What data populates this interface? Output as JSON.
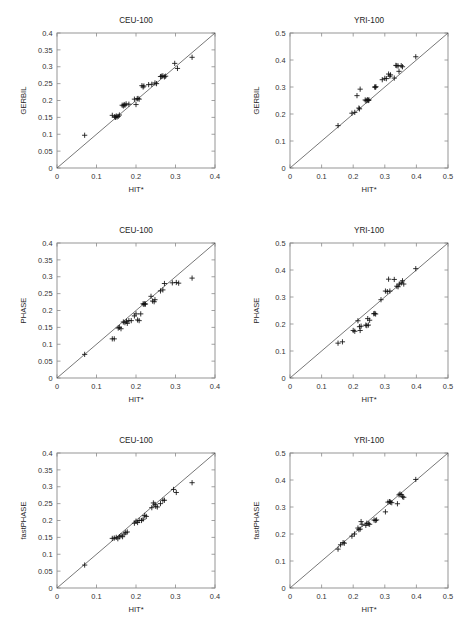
{
  "figure": {
    "width": 467,
    "height": 630,
    "background": "#ffffff",
    "marker_symbol": "plus",
    "marker_color": "#111111",
    "frame_color": "#8a8a8a",
    "identity_line_color": "#4a4a4a",
    "rows": 3,
    "columns": 2
  },
  "chart_data": [
    {
      "type": "scatter",
      "panel_id": "gerbil-ceu-100",
      "row": 0,
      "column": 0,
      "title": "CEU-100",
      "xlabel": "HIT*",
      "ylabel": "GERBIL",
      "xlim": [
        0,
        0.4
      ],
      "ylim": [
        0,
        0.4
      ],
      "xticks": [
        0,
        0.1,
        0.2,
        0.3,
        0.4
      ],
      "xticklabels": [
        "0",
        "0.1",
        "0.2",
        "0.3",
        "0.4"
      ],
      "yticks": [
        0,
        0.05,
        0.1,
        0.15,
        0.2,
        0.25,
        0.3,
        0.35,
        0.4
      ],
      "yticklabels": [
        "0",
        "0.05",
        "0.1",
        "0.15",
        "0.2",
        "0.25",
        "0.3",
        "0.35",
        "0.4"
      ],
      "grid": false,
      "legend": null,
      "identity_line": true,
      "x": [
        0.07,
        0.14,
        0.146,
        0.148,
        0.15,
        0.152,
        0.155,
        0.158,
        0.165,
        0.168,
        0.17,
        0.172,
        0.175,
        0.182,
        0.196,
        0.2,
        0.203,
        0.205,
        0.208,
        0.215,
        0.218,
        0.22,
        0.232,
        0.24,
        0.248,
        0.252,
        0.262,
        0.265,
        0.268,
        0.272,
        0.275,
        0.298,
        0.305,
        0.342
      ],
      "y": [
        0.097,
        0.156,
        0.152,
        0.15,
        0.154,
        0.151,
        0.153,
        0.157,
        0.186,
        0.184,
        0.188,
        0.186,
        0.19,
        0.189,
        0.204,
        0.188,
        0.205,
        0.206,
        0.204,
        0.244,
        0.24,
        0.243,
        0.247,
        0.248,
        0.252,
        0.25,
        0.271,
        0.272,
        0.273,
        0.27,
        0.272,
        0.31,
        0.295,
        0.328
      ]
    },
    {
      "type": "scatter",
      "panel_id": "gerbil-yri-100",
      "row": 0,
      "column": 1,
      "title": "YRI-100",
      "xlabel": "HIT*",
      "ylabel": "GERBIL",
      "xlim": [
        0,
        0.5
      ],
      "ylim": [
        0,
        0.5
      ],
      "xticks": [
        0,
        0.1,
        0.2,
        0.3,
        0.4,
        0.5
      ],
      "xticklabels": [
        "0",
        "0.1",
        "0.2",
        "0.3",
        "0.4",
        "0.5"
      ],
      "yticks": [
        0,
        0.1,
        0.2,
        0.3,
        0.4,
        0.5
      ],
      "yticklabels": [
        "0",
        "0.1",
        "0.2",
        "0.3",
        "0.4",
        "0.5"
      ],
      "grid": false,
      "legend": null,
      "identity_line": true,
      "x": [
        0.152,
        0.196,
        0.205,
        0.212,
        0.218,
        0.22,
        0.222,
        0.238,
        0.241,
        0.244,
        0.246,
        0.248,
        0.25,
        0.268,
        0.27,
        0.272,
        0.292,
        0.3,
        0.305,
        0.312,
        0.316,
        0.318,
        0.33,
        0.335,
        0.338,
        0.342,
        0.345,
        0.352,
        0.356,
        0.398
      ],
      "y": [
        0.157,
        0.203,
        0.206,
        0.268,
        0.222,
        0.219,
        0.292,
        0.252,
        0.249,
        0.251,
        0.253,
        0.25,
        0.252,
        0.3,
        0.299,
        0.301,
        0.327,
        0.332,
        0.331,
        0.348,
        0.34,
        0.345,
        0.333,
        0.38,
        0.379,
        0.378,
        0.358,
        0.379,
        0.375,
        0.412
      ]
    },
    {
      "type": "scatter",
      "panel_id": "phase-ceu-100",
      "row": 1,
      "column": 0,
      "title": "CEU-100",
      "xlabel": "HIT*",
      "ylabel": "PHASE",
      "xlim": [
        0,
        0.4
      ],
      "ylim": [
        0,
        0.4
      ],
      "xticks": [
        0,
        0.1,
        0.2,
        0.3,
        0.4
      ],
      "xticklabels": [
        "0",
        "0.1",
        "0.2",
        "0.3",
        "0.4"
      ],
      "yticks": [
        0,
        0.05,
        0.1,
        0.15,
        0.2,
        0.25,
        0.3,
        0.35,
        0.4
      ],
      "yticklabels": [
        "0",
        "0.05",
        "0.1",
        "0.15",
        "0.2",
        "0.25",
        "0.3",
        "0.35",
        "0.4"
      ],
      "grid": false,
      "legend": null,
      "identity_line": true,
      "x": [
        0.07,
        0.14,
        0.145,
        0.155,
        0.158,
        0.162,
        0.168,
        0.172,
        0.176,
        0.178,
        0.182,
        0.188,
        0.196,
        0.2,
        0.204,
        0.208,
        0.212,
        0.218,
        0.22,
        0.222,
        0.224,
        0.238,
        0.242,
        0.246,
        0.248,
        0.262,
        0.268,
        0.272,
        0.292,
        0.302,
        0.308,
        0.342
      ],
      "y": [
        0.07,
        0.116,
        0.116,
        0.148,
        0.15,
        0.146,
        0.166,
        0.164,
        0.168,
        0.162,
        0.17,
        0.17,
        0.184,
        0.19,
        0.172,
        0.17,
        0.19,
        0.22,
        0.218,
        0.22,
        0.219,
        0.242,
        0.228,
        0.226,
        0.232,
        0.258,
        0.261,
        0.28,
        0.282,
        0.283,
        0.281,
        0.296
      ]
    },
    {
      "type": "scatter",
      "panel_id": "phase-yri-100",
      "row": 1,
      "column": 1,
      "title": "YRI-100",
      "xlabel": "HIT*",
      "ylabel": "PHASE",
      "xlim": [
        0,
        0.5
      ],
      "ylim": [
        0,
        0.5
      ],
      "xticks": [
        0,
        0.1,
        0.2,
        0.3,
        0.4,
        0.5
      ],
      "xticklabels": [
        "0",
        "0.1",
        "0.2",
        "0.3",
        "0.4",
        "0.5"
      ],
      "yticks": [
        0,
        0.1,
        0.2,
        0.3,
        0.4,
        0.5
      ],
      "yticklabels": [
        "0",
        "0.1",
        "0.2",
        "0.3",
        "0.4",
        "0.5"
      ],
      "grid": false,
      "legend": null,
      "identity_line": true,
      "x": [
        0.152,
        0.166,
        0.2,
        0.205,
        0.215,
        0.22,
        0.222,
        0.225,
        0.24,
        0.243,
        0.246,
        0.248,
        0.252,
        0.265,
        0.268,
        0.271,
        0.288,
        0.302,
        0.308,
        0.312,
        0.316,
        0.33,
        0.338,
        0.342,
        0.346,
        0.352,
        0.356,
        0.36,
        0.398
      ],
      "y": [
        0.129,
        0.134,
        0.176,
        0.173,
        0.212,
        0.19,
        0.176,
        0.192,
        0.196,
        0.194,
        0.22,
        0.196,
        0.214,
        0.238,
        0.239,
        0.237,
        0.29,
        0.322,
        0.32,
        0.366,
        0.322,
        0.365,
        0.34,
        0.338,
        0.348,
        0.352,
        0.36,
        0.348,
        0.405
      ]
    },
    {
      "type": "scatter",
      "panel_id": "fastphase-ceu-100",
      "row": 2,
      "column": 0,
      "title": "CEU-100",
      "xlabel": "HIT*",
      "ylabel": "fastPHASE",
      "xlim": [
        0,
        0.4
      ],
      "ylim": [
        0,
        0.4
      ],
      "xticks": [
        0,
        0.1,
        0.2,
        0.3,
        0.4
      ],
      "xticklabels": [
        "0",
        "0.1",
        "0.2",
        "0.3",
        "0.4"
      ],
      "yticks": [
        0,
        0.05,
        0.1,
        0.15,
        0.2,
        0.25,
        0.3,
        0.35,
        0.4
      ],
      "yticklabels": [
        "0",
        "0.05",
        "0.1",
        "0.15",
        "0.2",
        "0.25",
        "0.3",
        "0.35",
        "0.4"
      ],
      "grid": false,
      "legend": null,
      "identity_line": true,
      "x": [
        0.07,
        0.14,
        0.145,
        0.15,
        0.154,
        0.158,
        0.162,
        0.166,
        0.17,
        0.174,
        0.178,
        0.196,
        0.2,
        0.204,
        0.208,
        0.214,
        0.218,
        0.222,
        0.226,
        0.24,
        0.244,
        0.248,
        0.25,
        0.254,
        0.262,
        0.268,
        0.272,
        0.295,
        0.302,
        0.342
      ],
      "y": [
        0.068,
        0.147,
        0.148,
        0.15,
        0.146,
        0.152,
        0.155,
        0.152,
        0.16,
        0.164,
        0.166,
        0.192,
        0.198,
        0.194,
        0.2,
        0.2,
        0.204,
        0.215,
        0.212,
        0.238,
        0.252,
        0.248,
        0.242,
        0.24,
        0.25,
        0.26,
        0.26,
        0.292,
        0.283,
        0.312
      ]
    },
    {
      "type": "scatter",
      "panel_id": "fastphase-yri-100",
      "row": 2,
      "column": 1,
      "title": "YRI-100",
      "xlabel": "HIT*",
      "ylabel": "fastPHASE",
      "xlim": [
        0,
        0.5
      ],
      "ylim": [
        0,
        0.5
      ],
      "xticks": [
        0,
        0.1,
        0.2,
        0.3,
        0.4,
        0.5
      ],
      "xticklabels": [
        "0",
        "0.1",
        "0.2",
        "0.3",
        "0.4",
        "0.5"
      ],
      "yticks": [
        0,
        0.1,
        0.2,
        0.3,
        0.4,
        0.5
      ],
      "yticklabels": [
        "0",
        "0.1",
        "0.2",
        "0.3",
        "0.4",
        "0.5"
      ],
      "grid": false,
      "legend": null,
      "identity_line": true,
      "x": [
        0.152,
        0.16,
        0.168,
        0.172,
        0.196,
        0.204,
        0.215,
        0.218,
        0.222,
        0.225,
        0.228,
        0.24,
        0.243,
        0.248,
        0.252,
        0.266,
        0.27,
        0.274,
        0.302,
        0.31,
        0.315,
        0.318,
        0.322,
        0.34,
        0.345,
        0.348,
        0.352,
        0.356,
        0.36,
        0.398
      ],
      "y": [
        0.144,
        0.16,
        0.168,
        0.166,
        0.192,
        0.2,
        0.222,
        0.216,
        0.218,
        0.246,
        0.236,
        0.232,
        0.24,
        0.238,
        0.236,
        0.252,
        0.25,
        0.252,
        0.282,
        0.318,
        0.32,
        0.318,
        0.316,
        0.312,
        0.345,
        0.348,
        0.346,
        0.338,
        0.336,
        0.402
      ]
    }
  ]
}
